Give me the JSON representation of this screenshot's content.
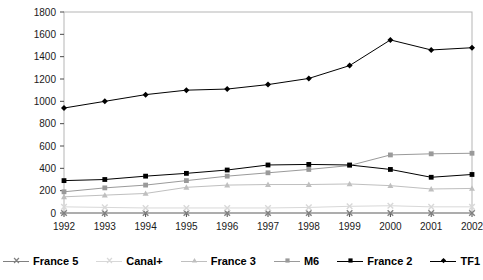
{
  "chart_data": {
    "type": "line",
    "title": "",
    "xlabel": "",
    "ylabel": "",
    "categories": [
      "1992",
      "1993",
      "1994",
      "1995",
      "1996",
      "1997",
      "1998",
      "1999",
      "2000",
      "2001",
      "2002"
    ],
    "x": [
      1992,
      1993,
      1994,
      1995,
      1996,
      1997,
      1998,
      1999,
      2000,
      2001,
      2002
    ],
    "ylim": [
      0,
      1800
    ],
    "yticks": [
      0,
      200,
      400,
      600,
      800,
      1000,
      1200,
      1400,
      1600,
      1800
    ],
    "grid": false,
    "legend_position": "bottom",
    "series": [
      {
        "name": "France 5",
        "marker": "x",
        "color": "#808080",
        "values": [
          0,
          0,
          0,
          0,
          0,
          0,
          0,
          0,
          0,
          0,
          0
        ]
      },
      {
        "name": "Canal+",
        "marker": "x",
        "color": "#d8d8d8",
        "values": [
          55,
          50,
          45,
          45,
          45,
          45,
          50,
          60,
          65,
          55,
          55
        ]
      },
      {
        "name": "France 3",
        "marker": "triangle",
        "color": "#bfbfbf",
        "values": [
          145,
          160,
          175,
          230,
          250,
          255,
          255,
          260,
          245,
          215,
          220
        ]
      },
      {
        "name": "M6",
        "marker": "square",
        "color": "#9a9a9a",
        "values": [
          190,
          225,
          250,
          290,
          330,
          360,
          390,
          425,
          520,
          530,
          535
        ]
      },
      {
        "name": "France 2",
        "marker": "square",
        "color": "#000000",
        "values": [
          290,
          300,
          330,
          355,
          385,
          430,
          435,
          430,
          390,
          320,
          345
        ]
      },
      {
        "name": "TF1",
        "marker": "diamond",
        "color": "#000000",
        "values": [
          940,
          1000,
          1060,
          1100,
          1110,
          1150,
          1205,
          1320,
          1550,
          1460,
          1480
        ]
      }
    ]
  },
  "legend": {
    "items": [
      {
        "label": "France 5"
      },
      {
        "label": "Canal+"
      },
      {
        "label": "France 3"
      },
      {
        "label": "M6"
      },
      {
        "label": "France 2"
      },
      {
        "label": "TF1"
      }
    ]
  },
  "axes": {
    "y_labels": [
      "1800",
      "1600",
      "1400",
      "1200",
      "1000",
      "800",
      "600",
      "400",
      "200",
      "0"
    ],
    "x_labels": [
      "1992",
      "1993",
      "1994",
      "1995",
      "1996",
      "1997",
      "1998",
      "1999",
      "2000",
      "2001",
      "2002"
    ]
  }
}
